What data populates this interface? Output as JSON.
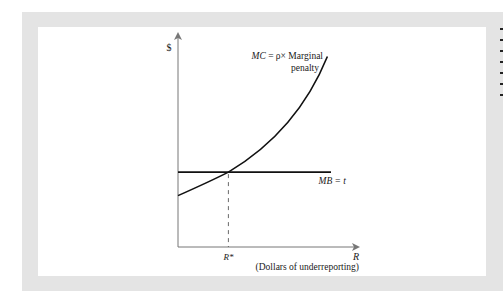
{
  "chart_data": {
    "type": "line",
    "title": "",
    "ylabel": "$",
    "xlabel": "R",
    "xlabel_note": "(Dollars of underreporting)",
    "x_ticks": [
      {
        "value": "R*",
        "label": "R*"
      }
    ],
    "xlim": [
      0,
      10
    ],
    "ylim": [
      0,
      10
    ],
    "grid": false,
    "legend": "none",
    "series": [
      {
        "name": "MC",
        "label_line1": "MC = ρ× Marginal",
        "label_line2": "penalty",
        "shape": "convex increasing",
        "points": [
          [
            0,
            2.4
          ],
          [
            1,
            2.95
          ],
          [
            2,
            3.6
          ],
          [
            2.8,
            3.5
          ],
          [
            3,
            3.95
          ],
          [
            4,
            4.55
          ],
          [
            5,
            5.3
          ],
          [
            6,
            6.2
          ],
          [
            7,
            7.3
          ],
          [
            8,
            8.6
          ],
          [
            8.3,
            9.0
          ]
        ]
      },
      {
        "name": "MB",
        "label": "MB = t",
        "shape": "horizontal",
        "points": [
          [
            0,
            3.5
          ],
          [
            8.5,
            3.5
          ]
        ]
      }
    ],
    "annotations": [
      {
        "text": "R*",
        "x": 2.8,
        "type": "dashed vertical drop from MC/MB intersection to x-axis"
      }
    ],
    "intersection": {
      "x": 2.8,
      "y": 3.5
    }
  }
}
